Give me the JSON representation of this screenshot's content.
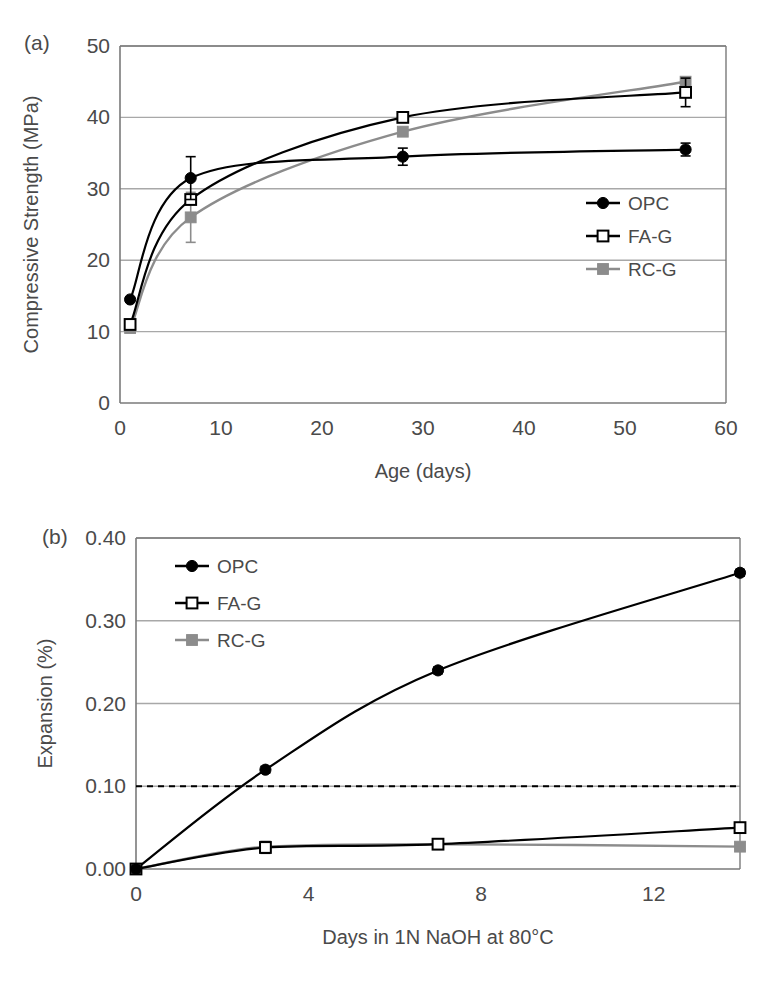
{
  "figure": {
    "panels": [
      {
        "label": "(a)",
        "chart_key": "chart_a"
      },
      {
        "label": "(b)",
        "chart_key": "chart_b"
      }
    ]
  },
  "colors": {
    "opc": "#000000",
    "fag": "#000000",
    "rcg": "#8c8c8c",
    "axis": "#7a7a7a",
    "grid": "#9a9a9a",
    "text": "#4a4a4a",
    "threshold": "#000000"
  },
  "chart_data": [
    {
      "id": "chart_a",
      "type": "line",
      "title": "",
      "panel_label": "(a)",
      "xlabel": "Age (days)",
      "ylabel": "Compressive Strength (MPa)",
      "xlim": [
        0,
        60
      ],
      "ylim": [
        0,
        50
      ],
      "xticks": [
        0,
        10,
        20,
        30,
        40,
        50,
        60
      ],
      "xtick_labels": [
        "0",
        "10",
        "20",
        "30",
        "40",
        "50",
        "60"
      ],
      "yticks": [
        0,
        10,
        20,
        30,
        40,
        50
      ],
      "ytick_labels": [
        "0",
        "10",
        "20",
        "30",
        "40",
        "50"
      ],
      "grid": "horizontal",
      "legend_position": "right-middle",
      "x": [
        1,
        7,
        28,
        56
      ],
      "series": [
        {
          "name": "OPC",
          "marker": "filled-circle",
          "color": "#000000",
          "values": [
            14.5,
            31.5,
            34.5,
            35.5
          ],
          "errors": [
            0,
            3.0,
            1.2,
            0.9
          ]
        },
        {
          "name": "FA-G",
          "marker": "open-square",
          "color": "#000000",
          "values": [
            11.0,
            28.5,
            40.0,
            43.5
          ],
          "errors": [
            0,
            0.6,
            0.5,
            2.0
          ]
        },
        {
          "name": "RC-G",
          "marker": "filled-square",
          "color": "#8c8c8c",
          "values": [
            10.5,
            26.0,
            38.0,
            45.0
          ],
          "errors": [
            0,
            3.5,
            0.5,
            0.6
          ]
        }
      ]
    },
    {
      "id": "chart_b",
      "type": "line",
      "title": "",
      "panel_label": "(b)",
      "xlabel": "Days in 1N NaOH at 80°C",
      "ylabel": "Expansion (%)",
      "xlim": [
        0,
        14
      ],
      "ylim": [
        0.0,
        0.4
      ],
      "xticks": [
        0,
        4,
        8,
        12
      ],
      "xtick_labels": [
        "0",
        "4",
        "8",
        "12"
      ],
      "yticks": [
        0.0,
        0.1,
        0.2,
        0.3,
        0.4
      ],
      "ytick_labels": [
        "0.00",
        "0.10",
        "0.20",
        "0.30",
        "0.40"
      ],
      "grid": "horizontal",
      "legend_position": "top-left",
      "threshold_line": {
        "value": 0.1,
        "style": "dashed",
        "label": ""
      },
      "x": [
        0,
        3,
        7,
        14
      ],
      "series": [
        {
          "name": "OPC",
          "marker": "filled-circle",
          "color": "#000000",
          "values": [
            0.0,
            0.12,
            0.24,
            0.358
          ],
          "errors": [
            0,
            0.004,
            0.004,
            0.004
          ]
        },
        {
          "name": "FA-G",
          "marker": "open-square",
          "color": "#000000",
          "values": [
            0.0,
            0.026,
            0.03,
            0.05
          ],
          "errors": [
            0,
            0.007,
            0.006,
            0.004
          ]
        },
        {
          "name": "RC-G",
          "marker": "filled-square",
          "color": "#8c8c8c",
          "values": [
            0.0,
            0.027,
            0.03,
            0.027
          ],
          "errors": [
            0,
            0.006,
            0.005,
            0.004
          ]
        }
      ]
    }
  ]
}
